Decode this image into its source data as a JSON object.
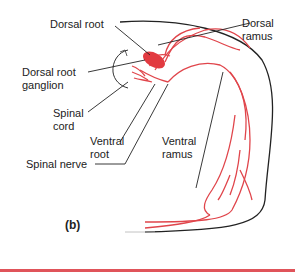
{
  "figure": {
    "panel_label": "(b)",
    "labels": {
      "dorsal_root": "Dorsal root",
      "dorsal_ramus_line1": "Dorsal",
      "dorsal_ramus_line2": "ramus",
      "dorsal_root_ganglion_line1": "Dorsal root",
      "dorsal_root_ganglion_line2": "ganglion",
      "spinal_cord_line1": "Spinal",
      "spinal_cord_line2": "cord",
      "ventral_root_line1": "Ventral",
      "ventral_root_line2": "root",
      "ventral_ramus_line1": "Ventral",
      "ventral_ramus_line2": "ramus",
      "spinal_nerve": "Spinal nerve"
    },
    "colors": {
      "nerve": "#e0454b",
      "ganglion": "#e23a40",
      "outline": "#222222",
      "leader": "#222222",
      "accent_bar": "#e0545a"
    }
  }
}
